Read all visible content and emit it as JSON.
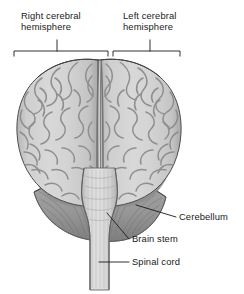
{
  "figure": {
    "view_type": "anatomical-diagram",
    "background_color": "#ffffff",
    "ink_color": "#1a1a1a",
    "palette": {
      "cortex_fill": "#c9c9c9",
      "cortex_light": "#dcdcdc",
      "cortex_shadow": "#a9a9a9",
      "sulcus_line": "#8a8a8a",
      "outline": "#4a4a4a",
      "cerebellum_fill": "#9a9a9a",
      "cerebellum_dark": "#6f6f6f",
      "cerebellum_striation": "#777777",
      "brainstem_fill": "#d2d2d2",
      "brainstem_shadow": "#b0b0b0",
      "brainstem_striation": "#bdbdbd",
      "fissure": "#7d7d7d"
    }
  },
  "brackets": [
    {
      "id": "right-hemisphere-bracket",
      "label": "Right cerebral\nhemisphere",
      "label_line_1": "Right cerebral",
      "label_line_2": "hemisphere",
      "span_start_x": 14,
      "span_end_x": 108,
      "tick_x": 57,
      "y": 51
    },
    {
      "id": "left-hemisphere-bracket",
      "label": "Left cerebral\nhemisphere",
      "label_line_1": "Left cerebral",
      "label_line_2": "hemisphere",
      "span_start_x": 113,
      "span_end_x": 180,
      "tick_x": 150,
      "y": 51
    }
  ],
  "labels": {
    "right_hemisphere_line1": "Right cerebral",
    "right_hemisphere_line2": "hemisphere",
    "left_hemisphere_line1": "Left cerebral",
    "left_hemisphere_line2": "hemisphere",
    "cerebellum": "Cerebellum",
    "brain_stem": "Brain stem",
    "spinal_cord": "Spinal cord"
  },
  "leader_lines": [
    {
      "id": "cerebellum-leader",
      "label": "Cerebellum",
      "from_x": 136,
      "from_y": 207,
      "to_x": 176,
      "to_y": 217
    },
    {
      "id": "brain-stem-leader",
      "label": "Brain stem",
      "from_x": 108,
      "from_y": 216,
      "to_x": 129,
      "to_y": 239
    },
    {
      "id": "spinal-cord-leader",
      "label": "Spinal cord",
      "from_x": 99,
      "from_y": 262,
      "to_x": 129,
      "to_y": 262
    }
  ],
  "structures": [
    {
      "id": "right-cerebral-hemisphere",
      "name": "Right cerebral hemisphere"
    },
    {
      "id": "left-cerebral-hemisphere",
      "name": "Left cerebral hemisphere"
    },
    {
      "id": "longitudinal-fissure",
      "name": "Longitudinal fissure"
    },
    {
      "id": "cerebellum",
      "name": "Cerebellum"
    },
    {
      "id": "brain-stem",
      "name": "Brain stem"
    },
    {
      "id": "spinal-cord",
      "name": "Spinal cord"
    }
  ]
}
